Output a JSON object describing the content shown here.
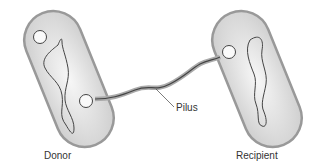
{
  "labels": {
    "donor": "Donor",
    "recipient": "Recipient",
    "pilus": "Pilus"
  },
  "colors": {
    "cell_fill": "#dcdcdc",
    "outline": "#888888",
    "line": "#444444"
  }
}
